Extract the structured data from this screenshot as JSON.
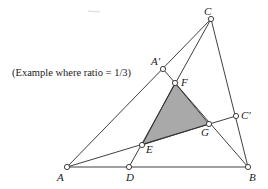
{
  "figure": {
    "caption": "(Example where ratio = 1/3)",
    "shade_color": "#a9a9a9",
    "line_color": "#2a2a2a",
    "points": {
      "A": {
        "label": "A",
        "x": 67,
        "y": 167
      },
      "B": {
        "label": "B",
        "x": 248,
        "y": 167
      },
      "C": {
        "label": "C",
        "x": 211,
        "y": 19
      },
      "D": {
        "label": "D",
        "x": 129,
        "y": 167
      },
      "A_prime": {
        "label": "A′",
        "x": 163,
        "y": 69
      },
      "C_prime": {
        "label": "C′",
        "x": 236,
        "y": 116
      },
      "E": {
        "label": "E",
        "x": 142,
        "y": 145
      },
      "F": {
        "label": "F",
        "x": 175,
        "y": 83
      },
      "G": {
        "label": "G",
        "x": 209,
        "y": 124
      }
    },
    "segments": [
      [
        "A",
        "B"
      ],
      [
        "A",
        "C"
      ],
      [
        "B",
        "C"
      ],
      [
        "A",
        "C_prime"
      ],
      [
        "C",
        "D"
      ],
      [
        "A_prime",
        "B"
      ]
    ],
    "shaded_triangle": [
      "E",
      "F",
      "G"
    ]
  }
}
